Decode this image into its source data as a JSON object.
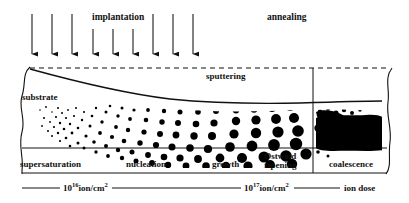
{
  "figure": {
    "process_labels": {
      "implantation": "implantation",
      "annealing": "annealing",
      "sputtering": "sputtering",
      "substrate": "substrate"
    },
    "stages": [
      {
        "id": "supersaturation",
        "label": "supersaturation"
      },
      {
        "id": "nucleation",
        "label": "nucleation"
      },
      {
        "id": "growth",
        "label": "growth"
      },
      {
        "id": "ostwald-ripening",
        "label_line1": "Ostwald",
        "label_line2": "ripening"
      },
      {
        "id": "coalescence",
        "label": "coalescence"
      }
    ],
    "axis": {
      "name": "ion dose",
      "ticks": [
        {
          "base": "10",
          "exponent": "16",
          "unit_numerator": "ion/cm",
          "unit_exponent": "2"
        },
        {
          "base": "10",
          "exponent": "17",
          "unit_numerator": "ion/cm",
          "unit_exponent": "2"
        }
      ]
    },
    "arrows": {
      "count": 9,
      "label": "implantation-arrow"
    },
    "colors": {
      "ink": "#111111",
      "particle": "#000000",
      "background": "#ffffff"
    }
  }
}
